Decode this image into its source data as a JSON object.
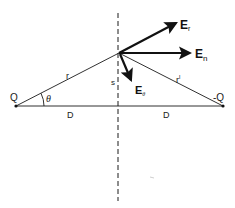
{
  "diagram": {
    "colors": {
      "line": "#1a1a1a",
      "arrow": "#111111",
      "background": "#ffffff"
    },
    "points": {
      "positive_charge": {
        "label": "Q",
        "x": 16,
        "y": 106
      },
      "negative_charge": {
        "label": "-Q",
        "x": 223,
        "y": 106
      },
      "field_point": {
        "x": 119,
        "y": 53
      }
    },
    "segments": {
      "r": {
        "label": "r"
      },
      "r_prime": {
        "label": "r",
        "superscript": "l"
      },
      "D_left": {
        "label": "D"
      },
      "D_right": {
        "label": "D"
      },
      "s": {
        "label": "s"
      }
    },
    "angle": {
      "label": "θ"
    },
    "vectors": {
      "E_r": {
        "main": "E",
        "sub": "r"
      },
      "E_n": {
        "main": "E",
        "sub": "n"
      },
      "E_theta": {
        "main": "E",
        "sub": "θ"
      }
    },
    "bisector": {
      "style": "dashed"
    }
  }
}
